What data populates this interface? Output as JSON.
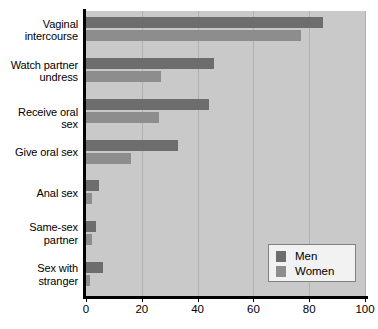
{
  "chart_data": {
    "type": "bar",
    "orientation": "horizontal",
    "title": "",
    "xlabel": "",
    "ylabel": "",
    "xlim": [
      0,
      100
    ],
    "xticks": [
      0,
      20,
      40,
      60,
      80,
      100
    ],
    "grid": true,
    "legend_position": "bottom-right",
    "categories": [
      "Vaginal intercourse",
      "Watch partner undress",
      "Receive oral sex",
      "Give oral sex",
      "Anal sex",
      "Same-sex partner",
      "Sex with stranger"
    ],
    "category_lines": [
      [
        "Vaginal",
        "intercourse"
      ],
      [
        "Watch partner",
        "undress"
      ],
      [
        "Receive oral sex"
      ],
      [
        "Give oral sex"
      ],
      [
        "Anal sex"
      ],
      [
        "Same-sex",
        "partner"
      ],
      [
        "Sex with",
        "stranger"
      ]
    ],
    "series": [
      {
        "name": "Men",
        "color": "#6d6d6d",
        "values": [
          85,
          46,
          44,
          33,
          4.6,
          3.5,
          6
        ]
      },
      {
        "name": "Women",
        "color": "#8d8d8d",
        "values": [
          77,
          27,
          26,
          16,
          2,
          2,
          1.5
        ]
      }
    ]
  },
  "legend": {
    "entries": [
      {
        "label": "Men"
      },
      {
        "label": "Women"
      }
    ]
  },
  "axis": {
    "tick_labels": [
      "0",
      "20",
      "40",
      "60",
      "80",
      "100"
    ]
  },
  "caption": {
    "text": ""
  },
  "colors": {
    "men": "#6d6d6d",
    "women": "#8d8d8d",
    "plot_background": "#c9c9c9",
    "gridline": "#b0b0b0",
    "axis": "#000000",
    "page_background": "#ffffff"
  }
}
